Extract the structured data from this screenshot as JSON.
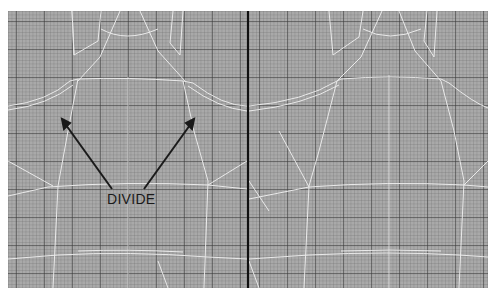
{
  "figure": {
    "annotation": {
      "label": "DIVIDE",
      "arrows": [
        {
          "from": [
            112,
            188
          ],
          "to": [
            62,
            122
          ]
        },
        {
          "from": [
            146,
            188
          ],
          "to": [
            189,
            122
          ]
        }
      ],
      "color": "#1a1a1a"
    },
    "viewports": [
      {
        "name": "left",
        "state": "before"
      },
      {
        "name": "right",
        "state": "after"
      }
    ],
    "colors": {
      "grid_background": "#a9a9a9",
      "grid_major": "#3c3c3c",
      "wireframe": "#f2f2f2",
      "divider": "#111111"
    }
  }
}
